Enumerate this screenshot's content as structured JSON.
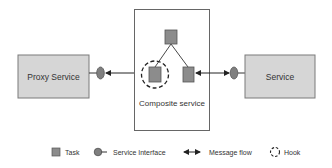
{
  "diagram": {
    "proxy_service": {
      "label": "Proxy Service"
    },
    "service": {
      "label": "Service"
    },
    "composite_service": {
      "label": "Composite service"
    },
    "tasks": [
      {
        "id": "top-task",
        "hooked": false
      },
      {
        "id": "left-task",
        "hooked": true
      },
      {
        "id": "right-task",
        "hooked": false
      }
    ]
  },
  "legend": {
    "task": "Task",
    "service_interface": "Service Interface",
    "message_flow": "Message flow",
    "hook": "Hook"
  },
  "colors": {
    "service_fill": "#d6d6d6",
    "service_border": "#7a7a7a",
    "task_fill": "#8c8c8c",
    "task_border": "#555555",
    "interface_fill": "#7f7f7f",
    "line": "#333333",
    "composite_border": "#666666"
  }
}
